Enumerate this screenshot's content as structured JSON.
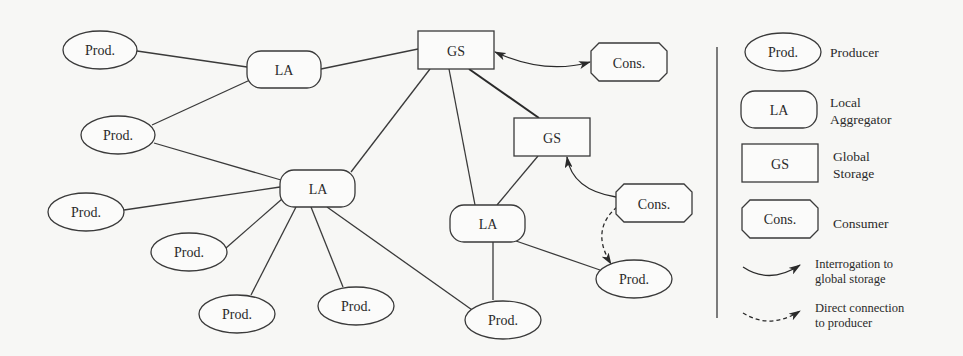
{
  "diagram": {
    "node_labels": {
      "producer": "Prod.",
      "local_aggregator": "LA",
      "global_storage": "GS",
      "consumer": "Cons."
    },
    "nodes": [
      {
        "id": "prod1",
        "type": "producer",
        "label": "Prod."
      },
      {
        "id": "prod2",
        "type": "producer",
        "label": "Prod."
      },
      {
        "id": "prod3",
        "type": "producer",
        "label": "Prod."
      },
      {
        "id": "prod4",
        "type": "producer",
        "label": "Prod."
      },
      {
        "id": "prod5",
        "type": "producer",
        "label": "Prod."
      },
      {
        "id": "prod6",
        "type": "producer",
        "label": "Prod."
      },
      {
        "id": "prod7",
        "type": "producer",
        "label": "Prod."
      },
      {
        "id": "prod8",
        "type": "producer",
        "label": "Prod."
      },
      {
        "id": "la1",
        "type": "local_aggregator",
        "label": "LA"
      },
      {
        "id": "la2",
        "type": "local_aggregator",
        "label": "LA"
      },
      {
        "id": "la3",
        "type": "local_aggregator",
        "label": "LA"
      },
      {
        "id": "gs1",
        "type": "global_storage",
        "label": "GS"
      },
      {
        "id": "gs2",
        "type": "global_storage",
        "label": "GS"
      },
      {
        "id": "cons1",
        "type": "consumer",
        "label": "Cons."
      },
      {
        "id": "cons2",
        "type": "consumer",
        "label": "Cons."
      }
    ],
    "edges": [
      {
        "from": "prod1",
        "to": "la1",
        "style": "solid"
      },
      {
        "from": "prod2",
        "to": "la1",
        "style": "solid"
      },
      {
        "from": "la1",
        "to": "gs1",
        "style": "solid"
      },
      {
        "from": "prod2",
        "to": "la2",
        "style": "solid"
      },
      {
        "from": "prod3",
        "to": "la2",
        "style": "solid"
      },
      {
        "from": "prod4",
        "to": "la2",
        "style": "solid"
      },
      {
        "from": "prod5",
        "to": "la2",
        "style": "solid"
      },
      {
        "from": "prod6",
        "to": "la2",
        "style": "solid"
      },
      {
        "from": "prod7",
        "to": "la2",
        "style": "solid"
      },
      {
        "from": "la2",
        "to": "gs1",
        "style": "solid"
      },
      {
        "from": "gs1",
        "to": "la3",
        "style": "solid"
      },
      {
        "from": "gs1",
        "to": "gs2",
        "style": "solid-thick"
      },
      {
        "from": "la3",
        "to": "gs2",
        "style": "solid"
      },
      {
        "from": "la3",
        "to": "prod7",
        "style": "solid"
      },
      {
        "from": "la3",
        "to": "prod8",
        "style": "solid"
      },
      {
        "from": "gs1",
        "to": "cons1",
        "style": "curved-double-arrow"
      },
      {
        "from": "cons2",
        "to": "gs2",
        "style": "curved-arrow"
      },
      {
        "from": "cons2",
        "to": "prod8",
        "style": "dashed-curved-arrow"
      }
    ]
  },
  "legend": {
    "items": [
      {
        "symbol": "ellipse",
        "symbol_label": "Prod.",
        "description": "Producer"
      },
      {
        "symbol": "rounded-rect",
        "symbol_label": "LA",
        "description_line1": "Local",
        "description_line2": "Aggregator"
      },
      {
        "symbol": "rect",
        "symbol_label": "GS",
        "description_line1": "Global",
        "description_line2": "Storage"
      },
      {
        "symbol": "octagon",
        "symbol_label": "Cons.",
        "description": "Consumer"
      },
      {
        "symbol": "solid-curved-arrow",
        "description_line1": "Interrogation to",
        "description_line2": "global storage"
      },
      {
        "symbol": "dashed-curved-arrow",
        "description_line1": "Direct connection",
        "description_line2": "to producer"
      }
    ]
  }
}
